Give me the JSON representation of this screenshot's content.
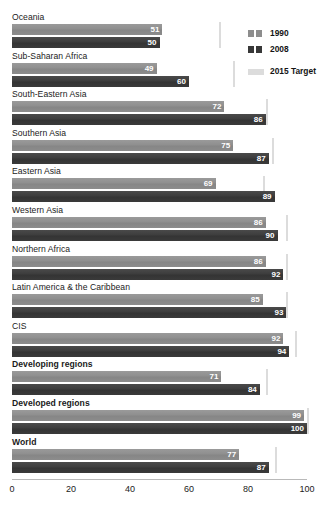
{
  "chart_title": "1990 and 2008 (Percentage)",
  "legend": {
    "position": "top-right",
    "items": [
      {
        "label": "1990",
        "color": "#8d8d8d",
        "style": "two-squares"
      },
      {
        "label": "2008",
        "color": "#383838",
        "style": "two-squares"
      },
      {
        "label": "2015 Target",
        "color": "#dcdcdc",
        "style": "bar"
      }
    ]
  },
  "axis": {
    "ticks": [
      "0",
      "20",
      "40",
      "60",
      "80",
      "100"
    ],
    "min": 0,
    "max": 100
  },
  "chart_data": {
    "type": "bar",
    "orientation": "horizontal",
    "title": "1990 and 2008 (Percentage)",
    "xlabel": "",
    "ylabel": "",
    "xlim": [
      0,
      100
    ],
    "grid": false,
    "legend_position": "top-right",
    "categories": [
      "Oceania",
      "Sub-Saharan Africa",
      "South-Eastern Asia",
      "Southern Asia",
      "Eastern Asia",
      "Western Asia",
      "Northern Africa",
      "Latin America & the Caribbean",
      "CIS",
      "Developing regions",
      "Developed regions",
      "World"
    ],
    "emphasized_categories": [
      "Developing regions",
      "Developed regions",
      "World"
    ],
    "series": [
      {
        "name": "1990",
        "color": "#8d8d8d",
        "values": [
          51,
          49,
          72,
          75,
          69,
          86,
          86,
          85,
          92,
          71,
          99,
          77
        ]
      },
      {
        "name": "2008",
        "color": "#383838",
        "values": [
          50,
          60,
          86,
          87,
          89,
          90,
          92,
          93,
          94,
          84,
          100,
          87
        ]
      },
      {
        "name": "2015 Target",
        "color": "#dcdcdc",
        "marker": "vertical-tick",
        "values": [
          70,
          75,
          86,
          88,
          85,
          93,
          93,
          93,
          96,
          86,
          100,
          89
        ]
      }
    ]
  },
  "rows": [
    {
      "label": "Oceania",
      "bold": false,
      "v1990": 51,
      "v2008": 50,
      "target": 70
    },
    {
      "label": "Sub-Saharan Africa",
      "bold": false,
      "v1990": 49,
      "v2008": 60,
      "target": 75
    },
    {
      "label": "South-Eastern Asia",
      "bold": false,
      "v1990": 72,
      "v2008": 86,
      "target": 86
    },
    {
      "label": "Southern Asia",
      "bold": false,
      "v1990": 75,
      "v2008": 87,
      "target": 88
    },
    {
      "label": "Eastern Asia",
      "bold": false,
      "v1990": 69,
      "v2008": 89,
      "target": 85
    },
    {
      "label": "Western Asia",
      "bold": false,
      "v1990": 86,
      "v2008": 90,
      "target": 93
    },
    {
      "label": "Northern Africa",
      "bold": false,
      "v1990": 86,
      "v2008": 92,
      "target": 93
    },
    {
      "label": "Latin America & the Caribbean",
      "bold": false,
      "v1990": 85,
      "v2008": 93,
      "target": 93
    },
    {
      "label": "CIS",
      "bold": false,
      "v1990": 92,
      "v2008": 94,
      "target": 96
    },
    {
      "label": "Developing regions",
      "bold": true,
      "v1990": 71,
      "v2008": 84,
      "target": 86
    },
    {
      "label": "Developed regions",
      "bold": true,
      "v1990": 99,
      "v2008": 100,
      "target": 100
    },
    {
      "label": "World",
      "bold": true,
      "v1990": 77,
      "v2008": 87,
      "target": 89
    }
  ]
}
